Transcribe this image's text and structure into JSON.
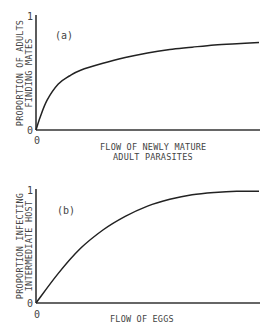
{
  "chart_data": [
    {
      "type": "line",
      "panel_label": "(a)",
      "title": "",
      "xlabel_lines": [
        "FLOW OF NEWLY MATURE",
        "ADULT PARASITES"
      ],
      "ylabel_lines": [
        "PROPORTION OF ADULTS",
        "FINDING MATES"
      ],
      "x_tick_labels": [
        "0"
      ],
      "y_tick_labels": [
        "0",
        "1"
      ],
      "ylim": [
        0,
        1
      ],
      "xlim": [
        0,
        1
      ],
      "grid": false,
      "legend": "none",
      "series": [
        {
          "name": "mating probability",
          "x": [
            0,
            0.02,
            0.05,
            0.1,
            0.15,
            0.2,
            0.3,
            0.4,
            0.5,
            0.6,
            0.7,
            0.8,
            0.9,
            1.0
          ],
          "values": [
            0,
            0.12,
            0.26,
            0.4,
            0.47,
            0.52,
            0.58,
            0.63,
            0.67,
            0.7,
            0.72,
            0.74,
            0.75,
            0.76
          ]
        }
      ]
    },
    {
      "type": "line",
      "panel_label": "(b)",
      "title": "",
      "xlabel_lines": [
        "FLOW OF EGGS"
      ],
      "ylabel_lines": [
        "PROPORTION INFECTING",
        "INTERMEDIATE HOST"
      ],
      "x_tick_labels": [
        "0"
      ],
      "y_tick_labels": [
        "0",
        "1"
      ],
      "ylim": [
        0,
        1
      ],
      "xlim": [
        0,
        1
      ],
      "grid": false,
      "legend": "none",
      "series": [
        {
          "name": "infection proportion",
          "x": [
            0,
            0.1,
            0.2,
            0.3,
            0.4,
            0.5,
            0.6,
            0.7,
            0.8,
            0.9,
            1.0
          ],
          "values": [
            0,
            0.26,
            0.48,
            0.64,
            0.76,
            0.85,
            0.91,
            0.95,
            0.97,
            0.98,
            0.98
          ]
        }
      ]
    }
  ]
}
